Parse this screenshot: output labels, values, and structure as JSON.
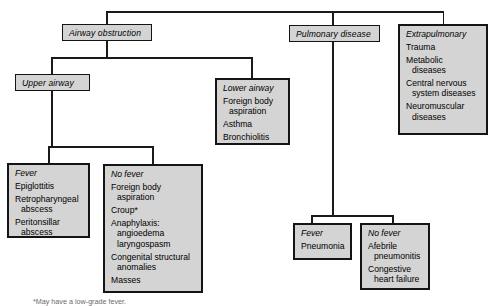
{
  "diagram": {
    "title_nodes": {
      "airway_obstruction": "Airway obstruction",
      "pulmonary_disease": "Pulmonary disease",
      "upper_airway": "Upper airway"
    },
    "boxes": {
      "lower_airway": {
        "header": "Lower airway",
        "items": [
          {
            "main": "Foreign body",
            "cont": "aspiration"
          },
          {
            "main": "Asthma",
            "cont": ""
          },
          {
            "main": "Bronchiolitis",
            "cont": ""
          }
        ]
      },
      "extrapulmonary": {
        "header": "Extrapulmonary",
        "items": [
          {
            "main": "Trauma",
            "cont": ""
          },
          {
            "main": "Metabolic",
            "cont": "diseases"
          },
          {
            "main": "Central nervous",
            "cont": "system diseases"
          },
          {
            "main": "Neuromuscular",
            "cont": "diseases"
          }
        ]
      },
      "upper_fever": {
        "header": "Fever",
        "items": [
          {
            "main": "Epiglottitis",
            "cont": ""
          },
          {
            "main": "Retropharyngeal",
            "cont": "abscess"
          },
          {
            "main": "Peritonsillar",
            "cont": "abscess"
          }
        ]
      },
      "upper_no_fever": {
        "header": "No fever",
        "items": [
          {
            "main": "Foreign body",
            "cont": "aspiration"
          },
          {
            "main": "Croup*",
            "cont": ""
          },
          {
            "main": "Anaphylaxis:",
            "cont": "angioedema",
            "cont2": "laryngospasm"
          },
          {
            "main": "Congenital structural",
            "cont": "anomalies"
          },
          {
            "main": "Masses",
            "cont": ""
          }
        ]
      },
      "pulm_fever": {
        "header": "Fever",
        "items": [
          {
            "main": "Pneumonia",
            "cont": ""
          }
        ]
      },
      "pulm_no_fever": {
        "header": "No fever",
        "items": [
          {
            "main": "Afebrile",
            "cont": "pneumonitis"
          },
          {
            "main": "Congestive",
            "cont": "heart failure"
          }
        ]
      }
    },
    "footnote": "*May have a low-grade fever.",
    "colors": {
      "box_fill": "#d4d4d4",
      "border": "#141414",
      "line": "#1a1a1a",
      "text": "#000000"
    }
  }
}
